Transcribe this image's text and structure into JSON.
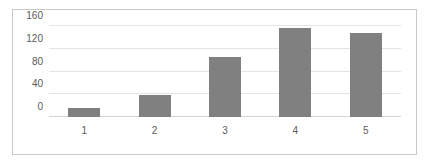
{
  "chart_data": {
    "type": "bar",
    "title": "",
    "subtitle": "",
    "xlabel": "",
    "ylabel": "",
    "categories": [
      "1",
      "2",
      "3",
      "4",
      "5"
    ],
    "values": [
      16,
      38,
      105,
      157,
      148
    ],
    "series": [
      {
        "name": "",
        "values": [
          16,
          38,
          105,
          157,
          148
        ]
      }
    ],
    "ylim": [
      0,
      160
    ],
    "yticks": [
      0,
      40,
      80,
      120,
      160
    ],
    "ytick_labels": [
      "0",
      "40",
      "80",
      "120",
      "160"
    ],
    "xtick_labels": [
      "1",
      "2",
      "3",
      "4",
      "5"
    ],
    "grid": true,
    "grid_axis": "y",
    "legend": false,
    "legend_position": "none",
    "annotations": [],
    "colors": {
      "bar": "#808080",
      "gridline": "#e4e4e4",
      "axis": "#d3d3d3",
      "tick_label": "#5a5a5a",
      "border": "#c9c9c9",
      "background": "#ffffff"
    }
  }
}
